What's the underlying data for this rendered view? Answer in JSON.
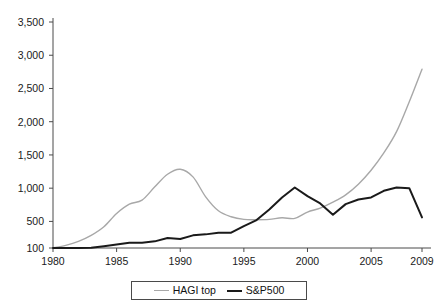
{
  "chart_data": {
    "type": "line",
    "title": "",
    "subtitle": "",
    "xlabel": "",
    "ylabel": "",
    "xlim": [
      1980,
      2009
    ],
    "ylim": [
      100,
      3500
    ],
    "grid": false,
    "legend_position": "bottom",
    "x_ticks": [
      1980,
      1985,
      1990,
      1995,
      2000,
      2005,
      2009
    ],
    "x_tick_labels": [
      "1980",
      "1985",
      "1990",
      "1995",
      "2000",
      "2005",
      "2009"
    ],
    "y_ticks": [
      100,
      500,
      1000,
      1500,
      2000,
      2500,
      3000,
      3500
    ],
    "y_tick_labels": [
      "100",
      "500",
      "1,000",
      "1,500",
      "2,000",
      "2,500",
      "3,000",
      "3,500"
    ],
    "x": [
      1980,
      1981,
      1982,
      1983,
      1984,
      1985,
      1986,
      1987,
      1988,
      1989,
      1990,
      1991,
      1992,
      1993,
      1994,
      1995,
      1996,
      1997,
      1998,
      1999,
      2000,
      2001,
      2002,
      2003,
      2004,
      2005,
      2006,
      2007,
      2008,
      2009
    ],
    "series": [
      {
        "name": "HAGI top",
        "color": "#a8a8a8",
        "width": 1.4,
        "values": [
          100,
          140,
          200,
          290,
          420,
          620,
          760,
          820,
          1020,
          1210,
          1285,
          1170,
          870,
          660,
          570,
          530,
          525,
          530,
          555,
          545,
          640,
          700,
          790,
          900,
          1060,
          1270,
          1530,
          1850,
          2300,
          2790
        ]
      },
      {
        "name": "S&P500",
        "color": "#1a1a1a",
        "width": 2,
        "values": [
          100,
          100,
          100,
          105,
          128,
          152,
          178,
          180,
          200,
          250,
          235,
          290,
          305,
          330,
          330,
          430,
          520,
          680,
          860,
          1010,
          880,
          770,
          600,
          760,
          830,
          860,
          960,
          1010,
          1000,
          560
        ]
      }
    ]
  },
  "legend": {
    "items": [
      {
        "label": "HAGI top",
        "swatch": "line-swatch-light"
      },
      {
        "label": "S&P500",
        "swatch": "line-swatch-dark"
      }
    ]
  },
  "axes": {
    "y_axis_name": "value-axis",
    "x_axis_name": "year-axis"
  }
}
